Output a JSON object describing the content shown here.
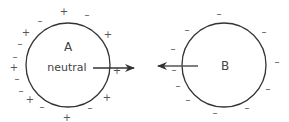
{
  "sphere_a": {
    "letter": "A",
    "state": "neutral",
    "center": [
      68,
      65
    ],
    "radius": 42,
    "charges": [
      {
        "s": "+",
        "x": 64,
        "y": 12
      },
      {
        "s": "–",
        "x": 87,
        "y": 15
      },
      {
        "s": "–",
        "x": 40,
        "y": 21
      },
      {
        "s": "+",
        "x": 26,
        "y": 33
      },
      {
        "s": "+",
        "x": 108,
        "y": 35
      },
      {
        "s": "–",
        "x": 20,
        "y": 44
      },
      {
        "s": "–",
        "x": 15,
        "y": 57
      },
      {
        "s": "+",
        "x": 14,
        "y": 68
      },
      {
        "s": "+",
        "x": 117,
        "y": 71
      },
      {
        "s": "–",
        "x": 17,
        "y": 79
      },
      {
        "s": "–",
        "x": 21,
        "y": 91
      },
      {
        "s": "+",
        "x": 107,
        "y": 98
      },
      {
        "s": "+",
        "x": 30,
        "y": 100
      },
      {
        "s": "–",
        "x": 42,
        "y": 107
      },
      {
        "s": "–",
        "x": 90,
        "y": 108
      },
      {
        "s": "+",
        "x": 67,
        "y": 118
      }
    ]
  },
  "sphere_b": {
    "letter": "B",
    "center": [
      224,
      65
    ],
    "radius": 42,
    "charges": [
      {
        "s": "–",
        "x": 219,
        "y": 14
      },
      {
        "s": "–",
        "x": 187,
        "y": 30
      },
      {
        "s": "–",
        "x": 264,
        "y": 32
      },
      {
        "s": "–",
        "x": 173,
        "y": 49
      },
      {
        "s": "–",
        "x": 277,
        "y": 62
      },
      {
        "s": "–",
        "x": 174,
        "y": 70
      },
      {
        "s": "–",
        "x": 178,
        "y": 86
      },
      {
        "s": "–",
        "x": 268,
        "y": 89
      },
      {
        "s": "–",
        "x": 188,
        "y": 100
      },
      {
        "s": "–",
        "x": 247,
        "y": 108
      },
      {
        "s": "–",
        "x": 215,
        "y": 113
      }
    ]
  },
  "arrows": {
    "a_force": {
      "x1": 93,
      "y1": 68,
      "x2": 134,
      "y2": 68,
      "direction": "right"
    },
    "b_force": {
      "x1": 198,
      "y1": 66,
      "x2": 158,
      "y2": 66,
      "direction": "left"
    }
  },
  "colors": {
    "circle_stroke": "#333333",
    "arrow": "#333333",
    "sign": "#555555",
    "label": "#444444"
  }
}
